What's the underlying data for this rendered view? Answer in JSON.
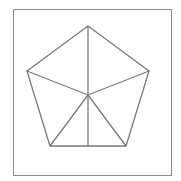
{
  "figure": {
    "shape_name": "regular-pentagon",
    "canvas": {
      "width": 181,
      "height": 181,
      "background": "#ffffff"
    },
    "frame": {
      "x": 13,
      "y": 9,
      "width": 159,
      "height": 167,
      "stroke": "#8c8c8c",
      "stroke_width": 1,
      "fill": "#ffffff"
    },
    "style": {
      "stroke": "#7a7a7a",
      "stroke_width": 1.3,
      "fill": "none",
      "line_cap": "round",
      "line_join": "round"
    },
    "center": {
      "name": "center",
      "x": 88,
      "y": 95
    },
    "vertices": [
      {
        "name": "apex-top",
        "label": "A",
        "x": 88,
        "y": 26
      },
      {
        "name": "upper-right",
        "label": "B",
        "x": 149,
        "y": 71
      },
      {
        "name": "lower-right",
        "label": "C",
        "x": 126,
        "y": 146
      },
      {
        "name": "lower-left",
        "label": "D",
        "x": 50,
        "y": 146
      },
      {
        "name": "upper-left",
        "label": "E",
        "x": 27,
        "y": 71
      }
    ],
    "bottom_edge_midpoint": {
      "name": "bottom-midpoint",
      "x": 88,
      "y": 146
    },
    "outline_path": "M 88 26 L 149 71 L 126 146 L 50 146 L 27 71 Z",
    "spokes": [
      {
        "name": "spoke-to-apex-top",
        "x1": 88,
        "y1": 95,
        "x2": 88,
        "y2": 26
      },
      {
        "name": "spoke-to-upper-right",
        "x1": 88,
        "y1": 95,
        "x2": 149,
        "y2": 71
      },
      {
        "name": "spoke-to-lower-right",
        "x1": 88,
        "y1": 95,
        "x2": 126,
        "y2": 146
      },
      {
        "name": "spoke-to-lower-left",
        "x1": 88,
        "y1": 95,
        "x2": 50,
        "y2": 146
      },
      {
        "name": "spoke-to-upper-left",
        "x1": 88,
        "y1": 95,
        "x2": 27,
        "y2": 71
      },
      {
        "name": "spoke-to-bottom-midpoint",
        "x1": 88,
        "y1": 95,
        "x2": 88,
        "y2": 146
      }
    ],
    "counts": {
      "sides": 5,
      "spokes": 6,
      "regions": 6
    }
  }
}
